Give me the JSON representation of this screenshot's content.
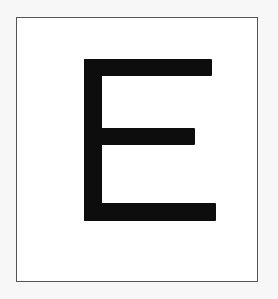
{
  "card": {
    "letter": "E",
    "letter_color": "#0d0d0d",
    "background_color": "#ffffff",
    "border_color": "#555555"
  }
}
